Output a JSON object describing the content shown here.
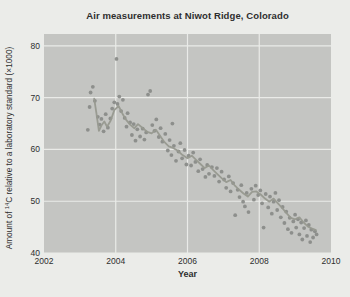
{
  "page": {
    "background": "#ebece9"
  },
  "chart": {
    "title": "Air measurements at Niwot Ridge, Colorado",
    "xlabel": "Year",
    "ylabel_prefix": "Amount of ",
    "ylabel_sup": "14",
    "ylabel_suffix": "C relative to a laboratory standard (×1000)"
  },
  "chart_data": {
    "type": "scatter",
    "title": "Air measurements at Niwot Ridge, Colorado",
    "xlabel": "Year",
    "ylabel": "Amount of ¹⁴C relative to a laboratory standard (×1000)",
    "xlim": [
      2002,
      2010
    ],
    "ylim": [
      40,
      82.3
    ],
    "xticks": [
      2002,
      2004,
      2006,
      2008,
      2010
    ],
    "yticks": [
      40,
      50,
      60,
      70,
      80
    ],
    "x_gridlines": [
      2004,
      2006,
      2008
    ],
    "y_gridlines": [
      40,
      50,
      60,
      70,
      80
    ],
    "grid": true,
    "legend": false,
    "colors": {
      "plot_bg": "#c4c5c2",
      "grid": "#eaebe8",
      "point": "#8a8c89",
      "trend": "#97998f",
      "text": "#2e2e2e"
    },
    "series": [
      {
        "name": "air measurements",
        "style": "points",
        "points": [
          [
            2003.22,
            63.8
          ],
          [
            2003.27,
            68.2
          ],
          [
            2003.3,
            71.0
          ],
          [
            2003.36,
            72.1
          ],
          [
            2003.42,
            69.4
          ],
          [
            2003.5,
            66.3
          ],
          [
            2003.55,
            64.8
          ],
          [
            2003.6,
            65.9
          ],
          [
            2003.66,
            63.5
          ],
          [
            2003.72,
            66.8
          ],
          [
            2003.78,
            64.2
          ],
          [
            2003.85,
            66.0
          ],
          [
            2003.9,
            67.9
          ],
          [
            2003.96,
            69.1
          ],
          [
            2004.02,
            77.5
          ],
          [
            2004.05,
            68.8
          ],
          [
            2004.1,
            70.2
          ],
          [
            2004.15,
            67.4
          ],
          [
            2004.2,
            69.6
          ],
          [
            2004.25,
            66.1
          ],
          [
            2004.3,
            64.4
          ],
          [
            2004.33,
            67.0
          ],
          [
            2004.4,
            65.2
          ],
          [
            2004.45,
            62.8
          ],
          [
            2004.5,
            64.9
          ],
          [
            2004.55,
            61.7
          ],
          [
            2004.6,
            63.9
          ],
          [
            2004.68,
            62.5
          ],
          [
            2004.75,
            64.0
          ],
          [
            2004.8,
            61.9
          ],
          [
            2004.85,
            63.3
          ],
          [
            2004.9,
            70.6
          ],
          [
            2004.96,
            71.3
          ],
          [
            2005.02,
            64.7
          ],
          [
            2005.08,
            63.6
          ],
          [
            2005.13,
            65.8
          ],
          [
            2005.2,
            62.4
          ],
          [
            2005.25,
            64.1
          ],
          [
            2005.3,
            61.5
          ],
          [
            2005.38,
            63.0
          ],
          [
            2005.45,
            59.8
          ],
          [
            2005.5,
            61.8
          ],
          [
            2005.55,
            58.9
          ],
          [
            2005.58,
            65.0
          ],
          [
            2005.62,
            60.7
          ],
          [
            2005.68,
            57.8
          ],
          [
            2005.75,
            59.6
          ],
          [
            2005.8,
            61.2
          ],
          [
            2005.85,
            58.3
          ],
          [
            2005.92,
            59.9
          ],
          [
            2005.97,
            57.1
          ],
          [
            2006.03,
            58.8
          ],
          [
            2006.1,
            56.9
          ],
          [
            2006.16,
            59.4
          ],
          [
            2006.22,
            57.6
          ],
          [
            2006.3,
            55.8
          ],
          [
            2006.35,
            58.1
          ],
          [
            2006.42,
            56.2
          ],
          [
            2006.5,
            54.7
          ],
          [
            2006.55,
            57.0
          ],
          [
            2006.6,
            55.3
          ],
          [
            2006.68,
            56.6
          ],
          [
            2006.75,
            54.9
          ],
          [
            2006.82,
            56.4
          ],
          [
            2006.88,
            53.8
          ],
          [
            2006.95,
            55.7
          ],
          [
            2007.02,
            54.2
          ],
          [
            2007.08,
            52.6
          ],
          [
            2007.15,
            54.8
          ],
          [
            2007.2,
            51.9
          ],
          [
            2007.27,
            53.5
          ],
          [
            2007.33,
            47.3
          ],
          [
            2007.4,
            52.2
          ],
          [
            2007.45,
            50.8
          ],
          [
            2007.5,
            53.1
          ],
          [
            2007.55,
            49.9
          ],
          [
            2007.6,
            49.0
          ],
          [
            2007.65,
            51.6
          ],
          [
            2007.7,
            47.9
          ],
          [
            2007.78,
            52.4
          ],
          [
            2007.85,
            50.3
          ],
          [
            2007.9,
            53.0
          ],
          [
            2007.97,
            51.2
          ],
          [
            2008.03,
            52.1
          ],
          [
            2008.08,
            49.6
          ],
          [
            2008.12,
            44.9
          ],
          [
            2008.18,
            51.4
          ],
          [
            2008.25,
            48.8
          ],
          [
            2008.3,
            50.9
          ],
          [
            2008.35,
            47.6
          ],
          [
            2008.4,
            49.9
          ],
          [
            2008.45,
            51.6
          ],
          [
            2008.5,
            48.3
          ],
          [
            2008.55,
            50.2
          ],
          [
            2008.6,
            46.9
          ],
          [
            2008.65,
            48.9
          ],
          [
            2008.7,
            45.8
          ],
          [
            2008.75,
            48.0
          ],
          [
            2008.8,
            44.6
          ],
          [
            2008.85,
            46.8
          ],
          [
            2008.9,
            43.9
          ],
          [
            2008.95,
            46.1
          ],
          [
            2009.0,
            47.4
          ],
          [
            2009.03,
            44.9
          ],
          [
            2009.08,
            46.5
          ],
          [
            2009.12,
            43.6
          ],
          [
            2009.17,
            45.9
          ],
          [
            2009.2,
            42.6
          ],
          [
            2009.25,
            44.8
          ],
          [
            2009.3,
            46.3
          ],
          [
            2009.33,
            43.3
          ],
          [
            2009.38,
            45.4
          ],
          [
            2009.42,
            42.1
          ],
          [
            2009.45,
            44.5
          ],
          [
            2009.5,
            43.0
          ],
          [
            2009.55,
            44.2
          ],
          [
            2009.6,
            43.6
          ]
        ]
      },
      {
        "name": "smoothed trend",
        "style": "line",
        "points": [
          [
            2003.4,
            69.8
          ],
          [
            2003.46,
            67.0
          ],
          [
            2003.53,
            63.6
          ],
          [
            2003.6,
            64.6
          ],
          [
            2003.68,
            65.4
          ],
          [
            2003.76,
            64.4
          ],
          [
            2003.86,
            65.6
          ],
          [
            2003.96,
            67.6
          ],
          [
            2004.08,
            68.4
          ],
          [
            2004.18,
            67.0
          ],
          [
            2004.28,
            65.8
          ],
          [
            2004.4,
            64.8
          ],
          [
            2004.52,
            64.1
          ],
          [
            2004.62,
            64.9
          ],
          [
            2004.74,
            64.2
          ],
          [
            2004.88,
            63.4
          ],
          [
            2005.0,
            63.1
          ],
          [
            2005.12,
            63.8
          ],
          [
            2005.24,
            62.6
          ],
          [
            2005.36,
            61.4
          ],
          [
            2005.48,
            60.6
          ],
          [
            2005.6,
            60.3
          ],
          [
            2005.72,
            59.8
          ],
          [
            2005.86,
            58.9
          ],
          [
            2006.0,
            58.3
          ],
          [
            2006.12,
            58.8
          ],
          [
            2006.24,
            58.0
          ],
          [
            2006.36,
            57.2
          ],
          [
            2006.48,
            56.4
          ],
          [
            2006.6,
            56.9
          ],
          [
            2006.72,
            56.0
          ],
          [
            2006.84,
            55.2
          ],
          [
            2006.96,
            54.4
          ],
          [
            2007.08,
            53.7
          ],
          [
            2007.2,
            54.1
          ],
          [
            2007.32,
            53.0
          ],
          [
            2007.44,
            52.2
          ],
          [
            2007.56,
            51.5
          ],
          [
            2007.68,
            50.9
          ],
          [
            2007.8,
            51.8
          ],
          [
            2007.92,
            51.9
          ],
          [
            2008.04,
            51.3
          ],
          [
            2008.16,
            50.5
          ],
          [
            2008.28,
            49.9
          ],
          [
            2008.4,
            50.5
          ],
          [
            2008.52,
            49.6
          ],
          [
            2008.64,
            48.7
          ],
          [
            2008.76,
            47.7
          ],
          [
            2008.88,
            46.8
          ],
          [
            2009.0,
            46.5
          ],
          [
            2009.12,
            46.9
          ],
          [
            2009.24,
            45.9
          ],
          [
            2009.36,
            45.1
          ],
          [
            2009.48,
            44.7
          ],
          [
            2009.58,
            44.4
          ]
        ]
      }
    ]
  }
}
